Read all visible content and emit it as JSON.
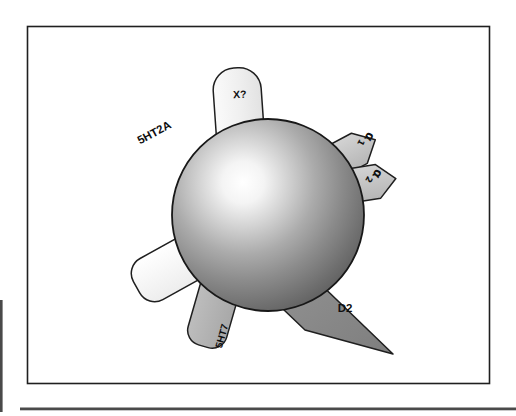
{
  "figure": {
    "title": "",
    "caption": "",
    "background_color": "#ffffff",
    "frame": {
      "name": "outer-frame",
      "x": 27,
      "y": 26,
      "width": 463,
      "height": 358,
      "stroke_color": "#1a1a1a",
      "fill_color": "#ffffff"
    },
    "bottom_rule": {
      "name": "bottom-rule",
      "x": 20,
      "y": 408,
      "width": 496,
      "height": 3,
      "color": "#3c3c3c"
    },
    "left_rule": {
      "name": "left-rule",
      "x": 0,
      "y": 300,
      "width": 3,
      "height": 112,
      "color": "#3c3c3c"
    }
  },
  "cell_body": {
    "name": "cell-sphere",
    "center_x": 268,
    "center_y": 215,
    "radius": 96,
    "highlight_x": 232,
    "highlight_y": 182,
    "highlight_color": "#ffffff",
    "mid_color": "#9a9a9a",
    "edge_color": "#4c4c4c",
    "outline_color": "#1a1a1a"
  },
  "receptors": [
    {
      "id": "5ht2a",
      "label": "5HT2A",
      "shape": "rounded-bar",
      "fill": "#f7f7f7",
      "stroke": "#1a1a1a",
      "label_rotation": -28,
      "label_x": 156,
      "label_y": 136,
      "font_size": 11
    },
    {
      "id": "x-unknown",
      "label": "X?",
      "shape": "rounded-bar",
      "fill": "#f2f2f2",
      "stroke": "#1a1a1a",
      "label_rotation": 0,
      "label_x": 240,
      "label_y": 97,
      "font_size": 10
    },
    {
      "id": "alpha1",
      "label": "α",
      "subscript": "1",
      "shape": "arrowhead",
      "fill": "#c2c2c2",
      "stroke": "#1a1a1a",
      "label_rotation": 118,
      "label_x": 363,
      "label_y": 136,
      "font_size": 11
    },
    {
      "id": "alpha2",
      "label": "α",
      "subscript": "2",
      "shape": "arrowhead",
      "fill": "#c2c2c2",
      "stroke": "#1a1a1a",
      "label_rotation": 118,
      "label_x": 371,
      "label_y": 173,
      "font_size": 11
    },
    {
      "id": "d2",
      "label": "D2",
      "shape": "wedge",
      "fill": "#8c8c8c",
      "stroke": "#1a1a1a",
      "label_rotation": 0,
      "label_x": 345,
      "label_y": 311,
      "font_size": 11
    },
    {
      "id": "5ht7",
      "label": "5HT7",
      "shape": "rounded-bar",
      "fill": "#b3b3b3",
      "stroke": "#1a1a1a",
      "label_rotation": -74,
      "label_x": 224,
      "label_y": 337,
      "font_size": 10
    }
  ]
}
